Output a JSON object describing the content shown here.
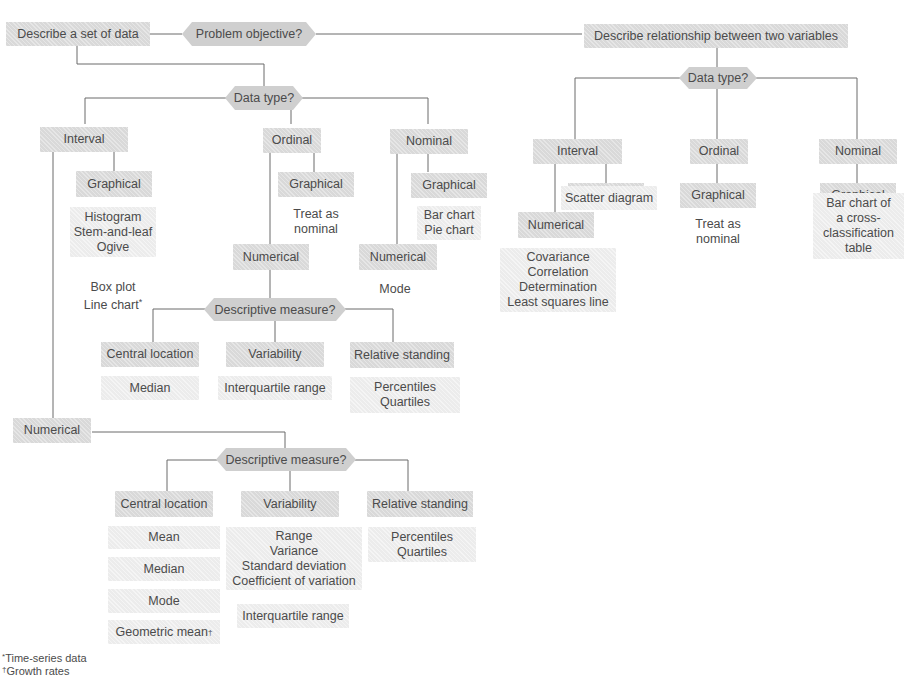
{
  "root": {
    "label": "Problem objective?"
  },
  "left_branch": {
    "objective": "Describe a set of data",
    "data_type": "Data type?",
    "interval": {
      "label": "Interval",
      "graphical": "Graphical",
      "graphical_techniques": "Histogram\nStem-and-leaf\nOgive",
      "graphical_extra": "Box plot\nLine chart",
      "graphical_extra_mark": "*",
      "numerical": "Numerical",
      "descriptive_measure": "Descriptive measure?",
      "central_location": "Central location",
      "central_items": [
        "Mean",
        "Median",
        "Mode",
        "Geometric mean"
      ],
      "geometric_mark": "†",
      "variability": "Variability",
      "variability_items": "Range\nVariance\nStandard deviation\nCoefficient of variation",
      "variability_extra": "Interquartile range",
      "relative_standing": "Relative standing",
      "relative_items": "Percentiles\nQuartiles"
    },
    "ordinal": {
      "label": "Ordinal",
      "graphical": "Graphical",
      "graphical_note": "Treat as\nnominal",
      "numerical": "Numerical",
      "descriptive_measure": "Descriptive measure?",
      "central_location": "Central location",
      "central_items": "Median",
      "variability": "Variability",
      "variability_items": "Interquartile range",
      "relative_standing": "Relative standing",
      "relative_items": "Percentiles\nQuartiles"
    },
    "nominal": {
      "label": "Nominal",
      "graphical": "Graphical",
      "graphical_techniques": "Bar chart\nPie chart",
      "numerical": "Numerical",
      "numerical_note": "Mode"
    }
  },
  "right_branch": {
    "objective": "Describe relationship between two variables",
    "data_type": "Data type?",
    "interval": {
      "label": "Interval",
      "graphical": "Graphical",
      "graphical_techniques": "Scatter diagram",
      "numerical": "Numerical",
      "numerical_techniques": "Covariance\nCorrelation\nDetermination\nLeast squares line"
    },
    "ordinal": {
      "label": "Ordinal",
      "graphical": "Graphical",
      "graphical_note": "Treat as\nnominal"
    },
    "nominal": {
      "label": "Nominal",
      "graphical": "Graphical",
      "graphical_techniques": "Bar chart of\na cross-\nclassification\ntable"
    }
  },
  "footnotes": {
    "asterisk_mark": "*",
    "asterisk_text": "Time-series data",
    "dagger_mark": "†",
    "dagger_text": "Growth rates"
  },
  "colors": {
    "box_fill": "#d9d9d9",
    "box_fill_light": "#ececec",
    "hex_fill": "#cfcfcf",
    "line": "#6a6a6a",
    "text": "#4b4b4b"
  }
}
